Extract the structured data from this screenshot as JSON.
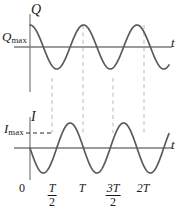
{
  "figure": {
    "title": "",
    "axis_color": "#6b6b6b",
    "curve_color": "#5b5b5b",
    "dash_color": "#b9b9b9",
    "text_color": "#1a1a1a",
    "background": "#ffffff"
  },
  "labels": {
    "q_axis": "Q",
    "q_max": "Q",
    "q_max_sub": "max",
    "i_axis": "I",
    "i_max": "I",
    "i_max_sub": "max",
    "t_axis_top": "t",
    "t_axis_bottom": "t"
  },
  "ticks": [
    {
      "label": "0",
      "type": "plain",
      "x": 22
    },
    {
      "num": "T",
      "den": "2",
      "type": "fraction",
      "x": 52
    },
    {
      "label": "T",
      "type": "italic",
      "x": 82
    },
    {
      "num": "3T",
      "den": "2",
      "type": "fraction",
      "x": 113
    },
    {
      "label": "2T",
      "type": "italic",
      "x": 143
    }
  ],
  "chart_data": [
    {
      "type": "line",
      "title": "Charge versus time",
      "xlabel": "t",
      "ylabel": "Q",
      "series": [
        {
          "name": "Q(t)",
          "expression": "Q = Qmax cos(2*pi*t/T)",
          "x": [
            0,
            0.25,
            0.5,
            0.75,
            1.0,
            1.25,
            1.5,
            1.75,
            2.0,
            2.25
          ],
          "y": [
            1,
            0,
            -1,
            0,
            1,
            0,
            -1,
            0,
            1,
            0
          ]
        }
      ],
      "x_ticks": [
        "0",
        "T/2",
        "T",
        "3T/2",
        "2T"
      ],
      "x_tick_values": [
        0,
        0.5,
        1.0,
        1.5,
        2.0
      ],
      "y_annotations": [
        {
          "label": "Qmax",
          "value": 1
        }
      ],
      "xlim": [
        0,
        2.3
      ],
      "ylim": [
        -1.15,
        1.15
      ],
      "grid": false,
      "legend": "none"
    },
    {
      "type": "line",
      "title": "Current versus time",
      "xlabel": "t",
      "ylabel": "I",
      "series": [
        {
          "name": "I(t)",
          "expression": "I = -Imax sin(2*pi*t/T)",
          "x": [
            0,
            0.25,
            0.5,
            0.75,
            1.0,
            1.25,
            1.5,
            1.75,
            2.0,
            2.25
          ],
          "y": [
            0,
            -1,
            0,
            1,
            0,
            -1,
            0,
            1,
            0,
            -1
          ]
        }
      ],
      "x_ticks": [
        "0",
        "T/2",
        "T",
        "3T/2",
        "2T"
      ],
      "x_tick_values": [
        0,
        0.5,
        1.0,
        1.5,
        2.0
      ],
      "y_annotations": [
        {
          "label": "Imax",
          "value": 1
        }
      ],
      "xlim": [
        0,
        2.3
      ],
      "ylim": [
        -1.15,
        1.15
      ],
      "grid": false,
      "legend": "none"
    }
  ],
  "guide_lines": {
    "description": "vertical dashed lines linking Q extrema to I peaks",
    "x_values": [
      "T/2",
      "T",
      "3T/2",
      "2T"
    ]
  }
}
